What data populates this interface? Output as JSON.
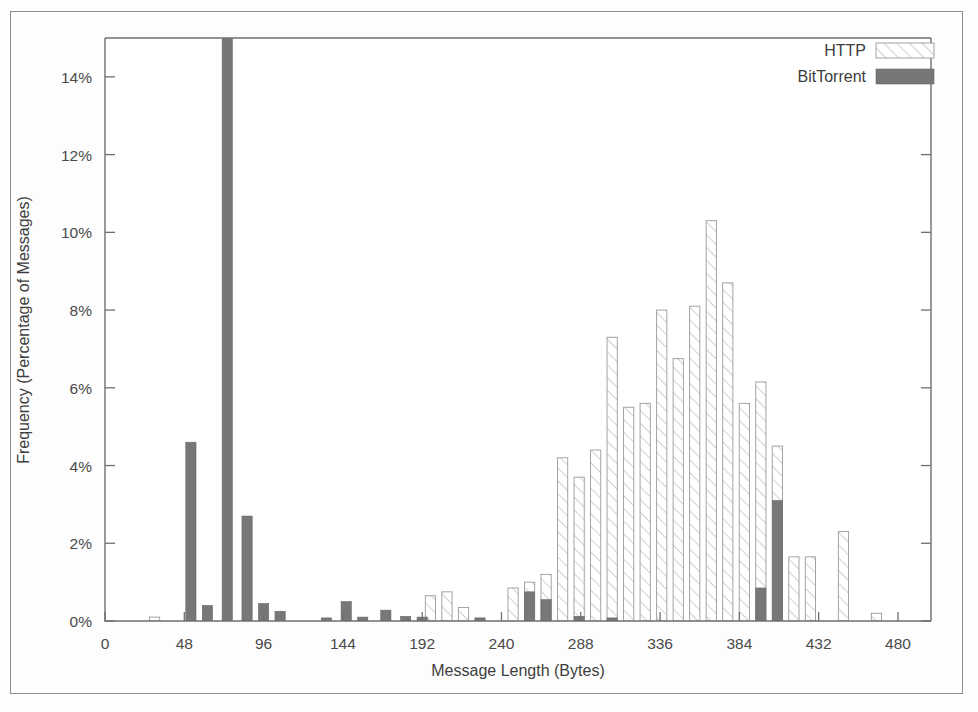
{
  "chart_data": {
    "type": "bar",
    "title": "",
    "subtitle": "",
    "xlabel": "Message Length (Bytes)",
    "ylabel": "Frequency (Percentage of Messages)",
    "xlim": [
      0,
      500
    ],
    "ylim": [
      0,
      15
    ],
    "grid": false,
    "legend_position": "top-right",
    "xticks": [
      0,
      48,
      96,
      144,
      192,
      240,
      288,
      336,
      384,
      432,
      480
    ],
    "xtick_labels": [
      "0",
      "48",
      "96",
      "144",
      "192",
      "240",
      "288",
      "336",
      "384",
      "432",
      "480"
    ],
    "yticks": [
      0,
      2,
      4,
      6,
      8,
      10,
      12,
      14
    ],
    "ytick_labels": [
      "0%",
      "2%",
      "4%",
      "6%",
      "8%",
      "10%",
      "12%",
      "14%"
    ],
    "bin_width_bytes": 10,
    "series": [
      {
        "name": "HTTP",
        "fill": "diagonal-hatch",
        "color": "#9a9a9a",
        "points": [
          {
            "x": 30,
            "y": 0.1
          },
          {
            "x": 197,
            "y": 0.65
          },
          {
            "x": 207,
            "y": 0.75
          },
          {
            "x": 217,
            "y": 0.35
          },
          {
            "x": 247,
            "y": 0.85
          },
          {
            "x": 257,
            "y": 1.0
          },
          {
            "x": 267,
            "y": 1.2
          },
          {
            "x": 277,
            "y": 4.2
          },
          {
            "x": 287,
            "y": 3.7
          },
          {
            "x": 297,
            "y": 4.4
          },
          {
            "x": 307,
            "y": 7.3
          },
          {
            "x": 317,
            "y": 5.5
          },
          {
            "x": 327,
            "y": 5.6
          },
          {
            "x": 337,
            "y": 8.0
          },
          {
            "x": 347,
            "y": 6.75
          },
          {
            "x": 357,
            "y": 8.1
          },
          {
            "x": 367,
            "y": 10.3
          },
          {
            "x": 377,
            "y": 8.7
          },
          {
            "x": 387,
            "y": 5.6
          },
          {
            "x": 397,
            "y": 6.15
          },
          {
            "x": 407,
            "y": 4.5
          },
          {
            "x": 417,
            "y": 1.65
          },
          {
            "x": 427,
            "y": 1.65
          },
          {
            "x": 447,
            "y": 2.3
          },
          {
            "x": 467,
            "y": 0.2
          }
        ]
      },
      {
        "name": "BitTorrent",
        "fill": "solid",
        "color": "#777777",
        "points": [
          {
            "x": 52,
            "y": 4.6
          },
          {
            "x": 62,
            "y": 0.4
          },
          {
            "x": 74,
            "y": 15.0
          },
          {
            "x": 86,
            "y": 2.7
          },
          {
            "x": 96,
            "y": 0.45
          },
          {
            "x": 106,
            "y": 0.25
          },
          {
            "x": 134,
            "y": 0.08
          },
          {
            "x": 146,
            "y": 0.5
          },
          {
            "x": 156,
            "y": 0.1
          },
          {
            "x": 170,
            "y": 0.28
          },
          {
            "x": 182,
            "y": 0.12
          },
          {
            "x": 192,
            "y": 0.1
          },
          {
            "x": 227,
            "y": 0.08
          },
          {
            "x": 257,
            "y": 0.75
          },
          {
            "x": 267,
            "y": 0.55
          },
          {
            "x": 287,
            "y": 0.12
          },
          {
            "x": 307,
            "y": 0.08
          },
          {
            "x": 397,
            "y": 0.85
          },
          {
            "x": 407,
            "y": 3.1
          }
        ]
      }
    ]
  },
  "legend": {
    "items": [
      {
        "label": "HTTP",
        "swatch": "diagonal-hatch"
      },
      {
        "label": "BitTorrent",
        "swatch": "solid-gray"
      }
    ]
  },
  "colors": {
    "axis": "#6f6f6f",
    "http": "#9a9a9a",
    "bittorrent": "#777777",
    "text": "#3d3d3d",
    "page_border": "#8d8d8d",
    "background": "#fdfdfd"
  }
}
